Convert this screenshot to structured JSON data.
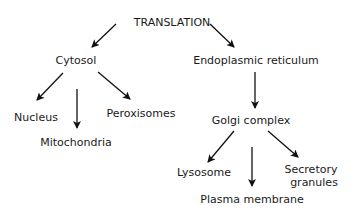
{
  "nodes": {
    "translation": "TRANSLATION",
    "cytosol": "Cytosol",
    "er": "Endoplasmic reticulum",
    "nucleus": "Nucleus",
    "mitochondria": "Mitochondria",
    "peroxisomes": "Peroxisomes",
    "golgi": "Golgi complex",
    "lysosome": "Lysosome",
    "plasma_membrane": "Plasma membrane",
    "secretory_1": "Secretory",
    "secretory_2": "granules"
  },
  "edges": [
    [
      "TRANSLATION",
      "Cytosol"
    ],
    [
      "TRANSLATION",
      "Endoplasmic reticulum"
    ],
    [
      "Cytosol",
      "Nucleus"
    ],
    [
      "Cytosol",
      "Mitochondria"
    ],
    [
      "Cytosol",
      "Peroxisomes"
    ],
    [
      "Endoplasmic reticulum",
      "Golgi complex"
    ],
    [
      "Golgi complex",
      "Lysosome"
    ],
    [
      "Golgi complex",
      "Plasma membrane"
    ],
    [
      "Golgi complex",
      "Secretory granules"
    ]
  ]
}
